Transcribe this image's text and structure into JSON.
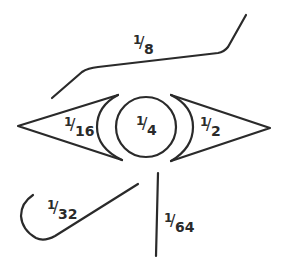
{
  "colors": {
    "stroke": "#2a2a2a",
    "background": "#ffffff"
  },
  "parts": [
    {
      "id": "eyebrow",
      "label": {
        "num": "1",
        "den": "8"
      }
    },
    {
      "id": "left-triangle",
      "label": {
        "num": "1",
        "den": "16"
      }
    },
    {
      "id": "pupil",
      "label": {
        "num": "1",
        "den": "4"
      }
    },
    {
      "id": "right-triangle",
      "label": {
        "num": "1",
        "den": "2"
      }
    },
    {
      "id": "curl",
      "label": {
        "num": "1",
        "den": "32"
      }
    },
    {
      "id": "vertical-stroke",
      "label": {
        "num": "1",
        "den": "64"
      }
    }
  ]
}
